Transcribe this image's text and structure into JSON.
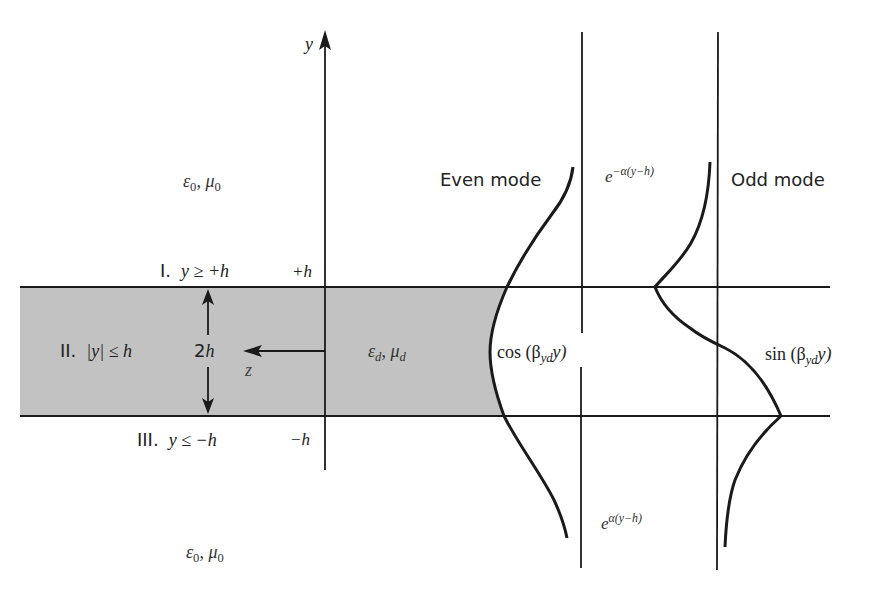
{
  "figure": {
    "colors": {
      "slab_fill": "#c2c2c2",
      "lines": "#1a1a1a",
      "text": "#222222",
      "background": "#ffffff"
    },
    "axes": {
      "y_label": "y",
      "z_label": "z",
      "plus_h": "+h",
      "minus_h": "−h",
      "thickness": "2h"
    },
    "regions": [
      {
        "id": "I",
        "numeral": "I.",
        "condition": "y ≥ +h",
        "eps": "ε",
        "eps_sub": "0",
        "mu": "μ",
        "mu_sub": "0"
      },
      {
        "id": "II",
        "numeral": "II.",
        "condition": "|y| ≤ h",
        "eps": "ε",
        "eps_sub": "d",
        "mu": "μ",
        "mu_sub": "d"
      },
      {
        "id": "III",
        "numeral": "III.",
        "condition": "y ≤ −h",
        "eps": "ε",
        "eps_sub": "0",
        "mu": "μ",
        "mu_sub": "0"
      }
    ],
    "modes": {
      "even": {
        "title": "Even mode",
        "inside_fn": "cos (β",
        "inside_sub": "yd",
        "inside_tail": "y)",
        "decay_upper_base": "e",
        "decay_upper_exp": "−α(y−h)",
        "decay_lower_base": "e",
        "decay_lower_exp": "α(y−h)"
      },
      "odd": {
        "title": "Odd mode",
        "inside_fn": "sin (β",
        "inside_sub": "yd",
        "inside_tail": "y)"
      }
    }
  }
}
